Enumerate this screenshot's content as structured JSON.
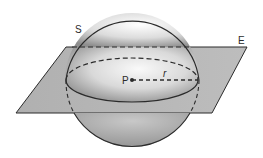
{
  "diagram": {
    "title": "",
    "labels": {
      "sphere": "S",
      "plane": "E",
      "center": "P",
      "radius": "r"
    },
    "colors": {
      "outline": "#2b2b2b",
      "plane_fill": "#b4b4b4",
      "sphere_light": "#f2f2f2",
      "sphere_dark": "#8c8c8c",
      "background": "#ffffff"
    }
  }
}
